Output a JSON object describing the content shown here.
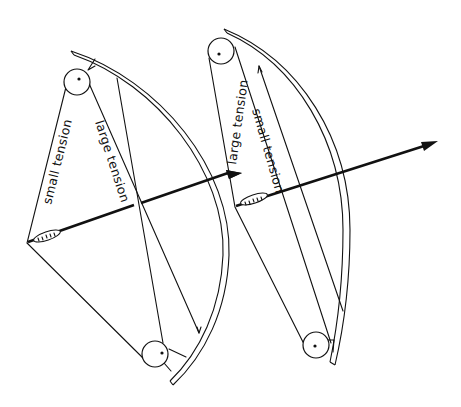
{
  "diagram": {
    "background": "#ffffff",
    "ink": "#111111",
    "left_bow": {
      "state": "drawn",
      "labels": {
        "string": "small tension",
        "cable": "large tension"
      }
    },
    "right_bow": {
      "state": "drawn (lower draw)",
      "labels": {
        "string": "large tension",
        "cable": "small tension"
      }
    }
  }
}
